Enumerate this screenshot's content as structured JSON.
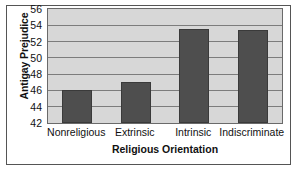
{
  "chart_data": {
    "type": "bar",
    "title": "",
    "xlabel": "Religious Orientation",
    "ylabel": "Antigay Prejudice",
    "categories": [
      "Nonreligious",
      "Extrinsic",
      "Intrinsic",
      "Indiscriminate"
    ],
    "values": [
      46.1,
      47.0,
      53.55,
      53.4
    ],
    "ylim": [
      42,
      56
    ],
    "yticks": [
      42,
      44,
      46,
      48,
      50,
      52,
      54,
      56
    ],
    "ytick_labels": [
      "42",
      "44",
      "46",
      "48",
      "50",
      "52",
      "54",
      "56"
    ],
    "grid": true,
    "legend": "none",
    "colors": {
      "bar_fill": "#4e4e4e",
      "bar_edge": "#3a3a3a",
      "plot_background": "#d7d7d7",
      "gridline": "#7c7c7c",
      "axis": "#6a6a6a",
      "frame": "#555555",
      "text": "#111111"
    }
  }
}
